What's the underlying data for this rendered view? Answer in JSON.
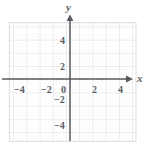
{
  "figure": {
    "type": "coordinate-plane",
    "background_color": "#ffffff",
    "grid": {
      "major_color": "#e0e0e2",
      "minor_color": "#ededef",
      "minor_style": "dotted",
      "subdivisions_per_unit": 4,
      "unit_px": 13.2,
      "bounds": {
        "left_px": 9,
        "top_px": 22,
        "right_px": 136,
        "bottom_px": 141
      }
    },
    "axes": {
      "color": "#58585e",
      "origin_px": {
        "x": 70,
        "y": 79
      },
      "x_axis": {
        "label": "x",
        "arrow": "right",
        "start_px": 2,
        "end_px": 128
      },
      "y_axis": {
        "label": "y",
        "arrow": "up",
        "start_px": 141,
        "end_px": 19
      }
    },
    "x_ticks": [
      {
        "label": "−4",
        "value": -4
      },
      {
        "label": "−2",
        "value": -2
      },
      {
        "label": "0",
        "value": 0
      },
      {
        "label": "2",
        "value": 2
      },
      {
        "label": "4",
        "value": 4
      }
    ],
    "y_ticks": [
      {
        "label": "4",
        "value": 4
      },
      {
        "label": "2",
        "value": 2
      },
      {
        "label": "−2",
        "value": -2
      },
      {
        "label": "−4",
        "value": -4
      }
    ],
    "x_range": [
      -5,
      5
    ],
    "y_range": [
      -5,
      5
    ],
    "data_series": []
  }
}
